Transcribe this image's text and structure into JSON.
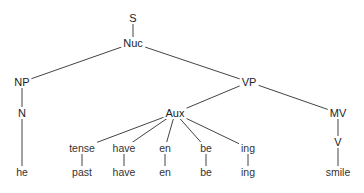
{
  "diagram": {
    "type": "syntax-tree",
    "line_color": "#444444",
    "text_color": "#222222",
    "nodes": {
      "S": {
        "label": "S",
        "x": 133,
        "y": 18
      },
      "Nuc": {
        "label": "Nuc",
        "x": 133,
        "y": 43
      },
      "NP": {
        "label": "NP",
        "x": 22,
        "y": 82
      },
      "N": {
        "label": "N",
        "x": 22,
        "y": 113
      },
      "he": {
        "label": "he",
        "x": 22,
        "y": 172
      },
      "VP": {
        "label": "VP",
        "x": 249,
        "y": 82
      },
      "Aux": {
        "label": "Aux",
        "x": 175,
        "y": 113
      },
      "tense": {
        "label": "tense",
        "x": 82,
        "y": 148
      },
      "past": {
        "label": "past",
        "x": 82,
        "y": 172
      },
      "have1": {
        "label": "have",
        "x": 124,
        "y": 148
      },
      "have2": {
        "label": "have",
        "x": 124,
        "y": 172
      },
      "en1": {
        "label": "en",
        "x": 165,
        "y": 148
      },
      "en2": {
        "label": "en",
        "x": 165,
        "y": 172
      },
      "be1": {
        "label": "be",
        "x": 206,
        "y": 148
      },
      "be2": {
        "label": "be",
        "x": 206,
        "y": 172
      },
      "ing1": {
        "label": "ing",
        "x": 248,
        "y": 148
      },
      "ing2": {
        "label": "ing",
        "x": 248,
        "y": 172
      },
      "MV": {
        "label": "MV",
        "x": 338,
        "y": 113
      },
      "V": {
        "label": "V",
        "x": 338,
        "y": 142
      },
      "smile": {
        "label": "smile",
        "x": 338,
        "y": 172
      }
    },
    "edges": [
      [
        "S",
        "Nuc"
      ],
      [
        "Nuc",
        "NP"
      ],
      [
        "Nuc",
        "VP"
      ],
      [
        "NP",
        "N"
      ],
      [
        "N",
        "he"
      ],
      [
        "VP",
        "Aux"
      ],
      [
        "VP",
        "MV"
      ],
      [
        "Aux",
        "tense"
      ],
      [
        "Aux",
        "have1"
      ],
      [
        "Aux",
        "en1"
      ],
      [
        "Aux",
        "be1"
      ],
      [
        "Aux",
        "ing1"
      ],
      [
        "tense",
        "past"
      ],
      [
        "have1",
        "have2"
      ],
      [
        "en1",
        "en2"
      ],
      [
        "be1",
        "be2"
      ],
      [
        "ing1",
        "ing2"
      ],
      [
        "MV",
        "V"
      ],
      [
        "V",
        "smile"
      ]
    ]
  }
}
